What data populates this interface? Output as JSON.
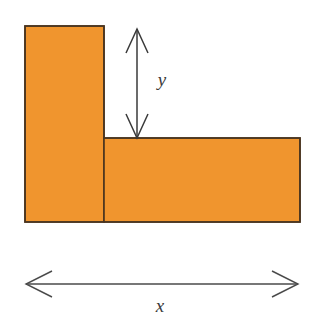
{
  "figure": {
    "background_color": "#ffffff"
  },
  "shape": {
    "name": "L-shape",
    "fill_color": "#F0952E",
    "stroke_color": "#4A3520",
    "stroke_width": 1.6,
    "parts": [
      {
        "name": "vertical-rectangle",
        "x": 25,
        "y": 26,
        "width": 79,
        "height": 196
      },
      {
        "name": "horizontal-rectangle",
        "x": 104,
        "y": 138,
        "width": 196,
        "height": 84
      }
    ],
    "outline_points": "25,26 104,26 104,138 300,138 300,222 25,222"
  },
  "dimensions": [
    {
      "name": "height-dimension",
      "label": "y",
      "orientation": "vertical",
      "axis_position": 137,
      "start": 29,
      "end": 138,
      "label_x": 162,
      "label_y": 86,
      "color": "#3a3a3a",
      "arrowheads": "both"
    },
    {
      "name": "width-dimension",
      "label": "x",
      "orientation": "horizontal",
      "axis_position": 284,
      "start": 26,
      "end": 298,
      "label_x": 160,
      "label_y": 312,
      "color": "#4a4a4a",
      "arrowheads": "both"
    }
  ]
}
